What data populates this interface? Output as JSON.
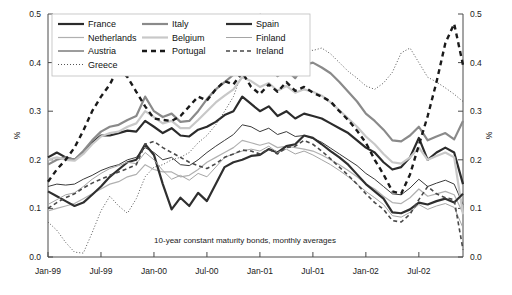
{
  "chart_data": {
    "type": "line",
    "title": "",
    "annotation": "10-year constant maturity bonds, monthly averages",
    "xlabel": "",
    "ylabel": "%",
    "ylabel_right": "%",
    "ylim": [
      0.0,
      0.5
    ],
    "yticks": [
      0.0,
      0.1,
      0.2,
      0.3,
      0.4,
      0.5
    ],
    "ytick_labels": [
      "0.0",
      "0.1",
      "0.2",
      "0.3",
      "0.4",
      "0.5"
    ],
    "xticks": [
      0,
      6,
      12,
      18,
      24,
      30,
      36,
      42
    ],
    "xtick_labels": [
      "Jan-99",
      "Jul-99",
      "Jan-00",
      "Jul-00",
      "Jan-01",
      "Jul-01",
      "Jan-02",
      "Jul-02"
    ],
    "x_count": 48,
    "grid": false,
    "legend_position": "upper-left-inside",
    "series": [
      {
        "name": "France",
        "color": "#2b2b2b",
        "width": 2.2,
        "dash": "none",
        "values": [
          0.205,
          0.215,
          0.205,
          0.2,
          0.215,
          0.235,
          0.25,
          0.25,
          0.255,
          0.26,
          0.258,
          0.28,
          0.268,
          0.255,
          0.265,
          0.25,
          0.248,
          0.262,
          0.268,
          0.278,
          0.292,
          0.3,
          0.33,
          0.315,
          0.3,
          0.31,
          0.29,
          0.3,
          0.285,
          0.295,
          0.29,
          0.285,
          0.275,
          0.265,
          0.255,
          0.24,
          0.225,
          0.215,
          0.195,
          0.18,
          0.185,
          0.205,
          0.245,
          0.2,
          0.215,
          0.225,
          0.215,
          0.15
        ]
      },
      {
        "name": "Netherlands",
        "color": "#b0b0b0",
        "width": 1.2,
        "dash": "none",
        "values": [
          0.095,
          0.1,
          0.105,
          0.11,
          0.12,
          0.13,
          0.14,
          0.15,
          0.155,
          0.165,
          0.17,
          0.19,
          0.18,
          0.175,
          0.175,
          0.165,
          0.168,
          0.18,
          0.195,
          0.205,
          0.215,
          0.225,
          0.24,
          0.235,
          0.23,
          0.235,
          0.225,
          0.228,
          0.225,
          0.222,
          0.218,
          0.21,
          0.2,
          0.19,
          0.178,
          0.165,
          0.15,
          0.14,
          0.125,
          0.112,
          0.11,
          0.122,
          0.14,
          0.125,
          0.13,
          0.135,
          0.128,
          0.09
        ]
      },
      {
        "name": "Austria",
        "color": "#3a3a3a",
        "width": 1.0,
        "dash": "none",
        "values": [
          0.145,
          0.15,
          0.148,
          0.15,
          0.16,
          0.168,
          0.178,
          0.185,
          0.19,
          0.2,
          0.205,
          0.225,
          0.215,
          0.2,
          0.205,
          0.19,
          0.188,
          0.2,
          0.215,
          0.228,
          0.24,
          0.252,
          0.272,
          0.268,
          0.258,
          0.265,
          0.252,
          0.258,
          0.248,
          0.25,
          0.244,
          0.236,
          0.224,
          0.212,
          0.2,
          0.188,
          0.172,
          0.16,
          0.145,
          0.13,
          0.128,
          0.142,
          0.16,
          0.145,
          0.152,
          0.158,
          0.15,
          0.108
        ]
      },
      {
        "name": "Greece",
        "color": "#555555",
        "width": 1.0,
        "dash": "1,2",
        "values": [
          0.072,
          0.055,
          0.03,
          0.01,
          0.008,
          0.05,
          0.095,
          0.125,
          0.105,
          0.09,
          0.12,
          0.165,
          0.185,
          0.19,
          0.2,
          0.205,
          0.215,
          0.235,
          0.25,
          0.272,
          0.3,
          0.33,
          0.38,
          0.43,
          0.5,
          0.495,
          0.47,
          0.46,
          0.44,
          0.43,
          0.425,
          0.43,
          0.418,
          0.4,
          0.382,
          0.368,
          0.352,
          0.345,
          0.358,
          0.38,
          0.42,
          0.43,
          0.4,
          0.37,
          0.36,
          0.348,
          0.335,
          0.32
        ]
      },
      {
        "name": "Italy",
        "color": "#8a8a8a",
        "width": 2.2,
        "dash": "none",
        "values": [
          0.19,
          0.2,
          0.205,
          0.2,
          0.218,
          0.24,
          0.258,
          0.268,
          0.272,
          0.282,
          0.29,
          0.33,
          0.3,
          0.288,
          0.295,
          0.278,
          0.28,
          0.3,
          0.325,
          0.345,
          0.36,
          0.375,
          0.4,
          0.392,
          0.378,
          0.39,
          0.372,
          0.385,
          0.368,
          0.395,
          0.4,
          0.39,
          0.378,
          0.36,
          0.34,
          0.32,
          0.295,
          0.28,
          0.262,
          0.24,
          0.238,
          0.25,
          0.268,
          0.24,
          0.248,
          0.255,
          0.242,
          0.28
        ]
      },
      {
        "name": "Belgium",
        "color": "#c8c8c8",
        "width": 2.2,
        "dash": "none",
        "values": [
          0.2,
          0.205,
          0.2,
          0.198,
          0.212,
          0.232,
          0.248,
          0.255,
          0.258,
          0.268,
          0.275,
          0.3,
          0.288,
          0.275,
          0.28,
          0.265,
          0.265,
          0.282,
          0.3,
          0.318,
          0.332,
          0.345,
          0.37,
          0.362,
          0.35,
          0.358,
          0.342,
          0.352,
          0.338,
          0.345,
          0.34,
          0.332,
          0.318,
          0.302,
          0.285,
          0.268,
          0.248,
          0.232,
          0.212,
          0.195,
          0.192,
          0.205,
          0.225,
          0.2,
          0.208,
          0.215,
          0.205,
          0.088
        ]
      },
      {
        "name": "Portugal",
        "color": "#1a1a1a",
        "width": 2.4,
        "dash": "5,4",
        "values": [
          0.155,
          0.18,
          0.2,
          0.225,
          0.26,
          0.3,
          0.33,
          0.355,
          0.39,
          0.37,
          0.34,
          0.31,
          0.285,
          0.282,
          0.28,
          0.29,
          0.31,
          0.33,
          0.322,
          0.345,
          0.362,
          0.355,
          0.38,
          0.35,
          0.335,
          0.355,
          0.34,
          0.36,
          0.342,
          0.35,
          0.338,
          0.33,
          0.32,
          0.3,
          0.282,
          0.26,
          0.235,
          0.2,
          0.17,
          0.135,
          0.13,
          0.17,
          0.23,
          0.29,
          0.36,
          0.44,
          0.48,
          0.395
        ]
      },
      {
        "name": "Spain",
        "color": "#2f2f2f",
        "width": 2.2,
        "dash": "none",
        "values": [
          0.135,
          0.125,
          0.115,
          0.105,
          0.112,
          0.128,
          0.145,
          0.165,
          0.18,
          0.195,
          0.2,
          0.232,
          0.21,
          0.15,
          0.098,
          0.122,
          0.105,
          0.132,
          0.115,
          0.15,
          0.185,
          0.195,
          0.2,
          0.208,
          0.21,
          0.222,
          0.215,
          0.228,
          0.232,
          0.25,
          0.245,
          0.232,
          0.218,
          0.205,
          0.19,
          0.17,
          0.15,
          0.135,
          0.12,
          0.092,
          0.09,
          0.098,
          0.112,
          0.108,
          0.115,
          0.12,
          0.112,
          0.13
        ]
      },
      {
        "name": "Finland",
        "color": "#a5a5a5",
        "width": 1.0,
        "dash": "none",
        "values": [
          0.108,
          0.118,
          0.128,
          0.132,
          0.145,
          0.16,
          0.172,
          0.182,
          0.188,
          0.195,
          0.192,
          0.215,
          0.2,
          0.178,
          0.16,
          0.168,
          0.158,
          0.172,
          0.165,
          0.185,
          0.205,
          0.212,
          0.218,
          0.222,
          0.218,
          0.228,
          0.215,
          0.222,
          0.212,
          0.218,
          0.21,
          0.2,
          0.19,
          0.178,
          0.165,
          0.15,
          0.135,
          0.122,
          0.108,
          0.085,
          0.082,
          0.092,
          0.108,
          0.098,
          0.105,
          0.11,
          0.102,
          0.06
        ]
      },
      {
        "name": "Ireland",
        "color": "#484848",
        "width": 1.6,
        "dash": "4,3",
        "values": [
          0.1,
          0.112,
          0.122,
          0.13,
          0.142,
          0.152,
          0.16,
          0.168,
          0.175,
          0.182,
          0.19,
          0.232,
          0.238,
          0.225,
          0.215,
          0.205,
          0.195,
          0.188,
          0.182,
          0.192,
          0.205,
          0.212,
          0.22,
          0.218,
          0.212,
          0.222,
          0.212,
          0.225,
          0.228,
          0.24,
          0.232,
          0.218,
          0.202,
          0.185,
          0.168,
          0.15,
          0.13,
          0.112,
          0.098,
          0.075,
          0.072,
          0.088,
          0.118,
          0.145,
          0.13,
          0.122,
          0.118,
          0.015
        ]
      }
    ]
  },
  "legend": {
    "rows": [
      [
        "France",
        "Italy",
        "Spain"
      ],
      [
        "Netherlands",
        "Belgium",
        "Finland"
      ],
      [
        "Austria",
        "Portugal",
        "Ireland"
      ],
      [
        "Greece",
        "",
        ""
      ]
    ]
  }
}
